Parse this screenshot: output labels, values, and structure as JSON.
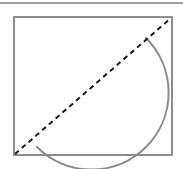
{
  "figure": {
    "title": "Geometric figure: rectangle with diagonal and circular arc",
    "type": "geometry-diagram",
    "canvas": {
      "width": 183,
      "height": 169,
      "background": "#ffffff"
    },
    "colors": {
      "rule": "#9b9b9b",
      "rectangle_stroke": "#8d8d8d",
      "arc_stroke": "#8a8a8a",
      "diagonal_stroke": "#1a1a1a"
    },
    "top_rule": {
      "name": "top-rule",
      "x1": 0,
      "y1": 3,
      "x2": 183,
      "y2": 3,
      "stroke_width": 2
    },
    "rectangle": {
      "name": "outer-rectangle",
      "x": 14,
      "y": 17,
      "width": 158,
      "height": 138,
      "stroke_width": 2,
      "fill": "none"
    },
    "diagonal": {
      "name": "dashed-diagonal",
      "x1": 15,
      "y1": 154,
      "x2": 171,
      "y2": 18,
      "stroke_width": 2,
      "dash_pattern": "5,4",
      "style": "dashed"
    },
    "arc": {
      "name": "major-arc",
      "start_x": 37,
      "start_y": 147,
      "end_x": 146,
      "end_y": 38,
      "radius_x": 77,
      "radius_y": 77,
      "x_axis_rotation": 0,
      "large_arc_flag": 1,
      "sweep_flag": 0,
      "stroke_width": 2,
      "fill": "none",
      "apex_x": 100,
      "apex_y": 29,
      "leftmost_x": 35,
      "leftmost_y": 100
    }
  }
}
